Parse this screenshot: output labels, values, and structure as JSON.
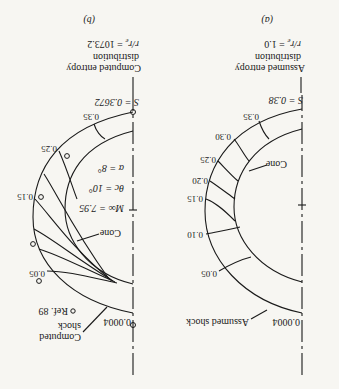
{
  "figure": {
    "orientation": "rotated-180",
    "panel_a": {
      "caption": "(a)",
      "shock_label": "Assumed shock",
      "cone_label": "Cone",
      "tip_entropy": "0.0004",
      "base_entropy": "S = 0.38",
      "entropy_label_1": "Assumed entropy",
      "entropy_label_2": "distribution",
      "entropy_label_3": "r/r",
      "entropy_label_3_sub": "e",
      "entropy_label_3_val": " = 1.0",
      "entropy_lines": [
        "0.05",
        "0.10",
        "0.15",
        "0.20",
        "0.25",
        "0.30",
        "0.35"
      ]
    },
    "panel_b": {
      "caption": "(b)",
      "shock_label_1": "Computed",
      "shock_label_2": "shock",
      "ref_label": "Ref. 89",
      "cone_label": "Cone",
      "tip_entropy": "0.0004",
      "base_entropy": "S = 0.3672",
      "entropy_label_1": "Computed entropy",
      "entropy_label_2": "distribution",
      "entropy_label_3": "r/r",
      "entropy_label_3_sub": "e",
      "entropy_label_3_val": " = 1073.2",
      "mach": "M∞ = 7.95",
      "theta": "θc = 10°",
      "alpha": "α = 8°",
      "entropy_lines": [
        "0.05",
        "0.15",
        "0.25",
        "0.35"
      ]
    }
  },
  "colors": {
    "ink": "#1a1a1a",
    "paper": "#f7f6f2"
  }
}
